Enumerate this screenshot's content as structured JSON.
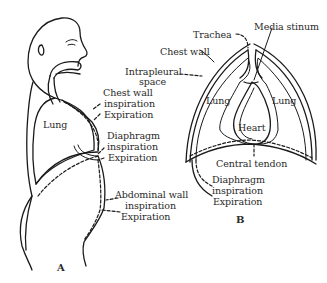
{
  "figure": {
    "panel_a": {
      "id_label": "A",
      "labels": {
        "lung": "Lung",
        "chest_wall": "Chest wall",
        "chest_wall_inspiration": "inspiration",
        "chest_wall_expiration": "Expiration",
        "diaphragm": "Diaphragm",
        "diaphragm_inspiration": "inspiration",
        "diaphragm_expiration": "Expiration",
        "abdominal_wall": "Abdominal wall",
        "abdominal_wall_inspiration": "inspiration",
        "abdominal_wall_expiration": "Expiration"
      }
    },
    "panel_b": {
      "id_label": "B",
      "labels": {
        "trachea": "Trachea",
        "mediastinum": "Media stinum",
        "chest_wall": "Chest wall",
        "intrapleural": "Intrapleural",
        "intrapleural_space": "space",
        "lung_left": "Lung",
        "lung_right": "Lung",
        "heart": "Heart",
        "central_tendon": "Central tendon",
        "diaphragm": "Diaphragm",
        "diaphragm_inspiration": "inspiration",
        "diaphragm_expiration": "Expiration"
      }
    },
    "legend": {
      "solid_line": "Expiration",
      "dashed_line": "inspiration"
    }
  }
}
